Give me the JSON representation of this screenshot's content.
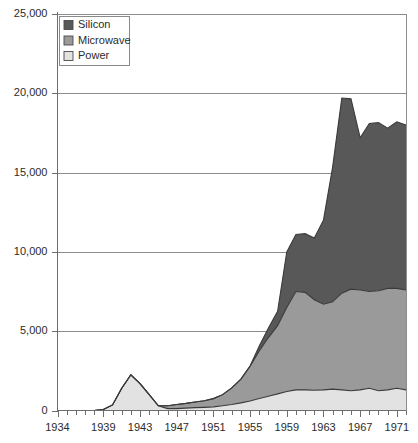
{
  "chart_data": {
    "type": "area",
    "stacked": true,
    "title": "",
    "subtitle": "",
    "xlabel": "",
    "ylabel": "",
    "xlim": [
      1934,
      1972
    ],
    "ylim": [
      0,
      25000
    ],
    "grid": true,
    "legend_position": "top-left-inside",
    "y_tick_labels": [
      "25,000",
      "20,000",
      "15,000",
      "10,000",
      "5,000",
      "0"
    ],
    "y_tick_values": [
      25000,
      20000,
      15000,
      10000,
      5000,
      0
    ],
    "x_tick_labels": [
      "1934",
      "1939",
      "1943",
      "1947",
      "1951",
      "1955",
      "1959",
      "1963",
      "1967",
      "1971"
    ],
    "x_tick_values": [
      1934,
      1939,
      1943,
      1947,
      1951,
      1955,
      1959,
      1963,
      1967,
      1971
    ],
    "x_minor_step": 1,
    "x": [
      1934,
      1935,
      1936,
      1937,
      1938,
      1939,
      1940,
      1941,
      1942,
      1943,
      1944,
      1945,
      1946,
      1947,
      1948,
      1949,
      1950,
      1951,
      1952,
      1953,
      1954,
      1955,
      1956,
      1957,
      1958,
      1959,
      1960,
      1961,
      1962,
      1963,
      1964,
      1965,
      1966,
      1967,
      1968,
      1969,
      1970,
      1971,
      1972
    ],
    "series": [
      {
        "name": "Power",
        "color": "#e2e2e2",
        "values": [
          0,
          0,
          0,
          0,
          0,
          60,
          350,
          1400,
          2250,
          1700,
          1000,
          300,
          120,
          120,
          150,
          180,
          200,
          230,
          300,
          380,
          480,
          600,
          760,
          900,
          1050,
          1200,
          1300,
          1300,
          1280,
          1300,
          1350,
          1300,
          1250,
          1300,
          1400,
          1250,
          1300,
          1400,
          1300
        ]
      },
      {
        "name": "Microwave",
        "color": "#9a9a9a",
        "values": [
          0,
          0,
          0,
          0,
          0,
          0,
          0,
          0,
          0,
          0,
          0,
          0,
          180,
          260,
          300,
          360,
          420,
          520,
          700,
          1050,
          1500,
          2200,
          3000,
          3700,
          4300,
          5300,
          6200,
          6150,
          5700,
          5400,
          5500,
          6100,
          6400,
          6300,
          6100,
          6300,
          6400,
          6300,
          6300
        ]
      },
      {
        "name": "Silicon",
        "color": "#585858",
        "values": [
          0,
          0,
          0,
          0,
          0,
          0,
          0,
          0,
          0,
          0,
          0,
          0,
          0,
          0,
          0,
          0,
          0,
          0,
          0,
          0,
          0,
          0,
          300,
          600,
          900,
          3500,
          3600,
          3700,
          3900,
          5300,
          8500,
          12300,
          12000,
          9600,
          10600,
          10600,
          10100,
          10500,
          10400
        ]
      }
    ],
    "cumulative_totals": [
      0,
      0,
      0,
      0,
      0,
      60,
      350,
      1400,
      2250,
      1700,
      1000,
      300,
      300,
      380,
      450,
      540,
      620,
      750,
      1000,
      1430,
      1980,
      2800,
      4060,
      5200,
      6250,
      10000,
      11100,
      11150,
      10880,
      12000,
      15350,
      19700,
      19650,
      17200,
      18100,
      18150,
      17800,
      18200,
      18000
    ],
    "legend_entries": [
      {
        "label": "Silicon",
        "color": "#585858"
      },
      {
        "label": "Microwave",
        "color": "#9a9a9a"
      },
      {
        "label": "Power",
        "color": "#e2e2e2"
      }
    ]
  },
  "colors": {
    "silicon": "#585858",
    "microwave": "#9a9a9a",
    "power": "#e2e2e2",
    "gridline": "#8c8c8c",
    "axis": "#6e6e6e",
    "text": "#2b2b2b",
    "outline": "#3a3a3a",
    "background": "#ffffff"
  }
}
